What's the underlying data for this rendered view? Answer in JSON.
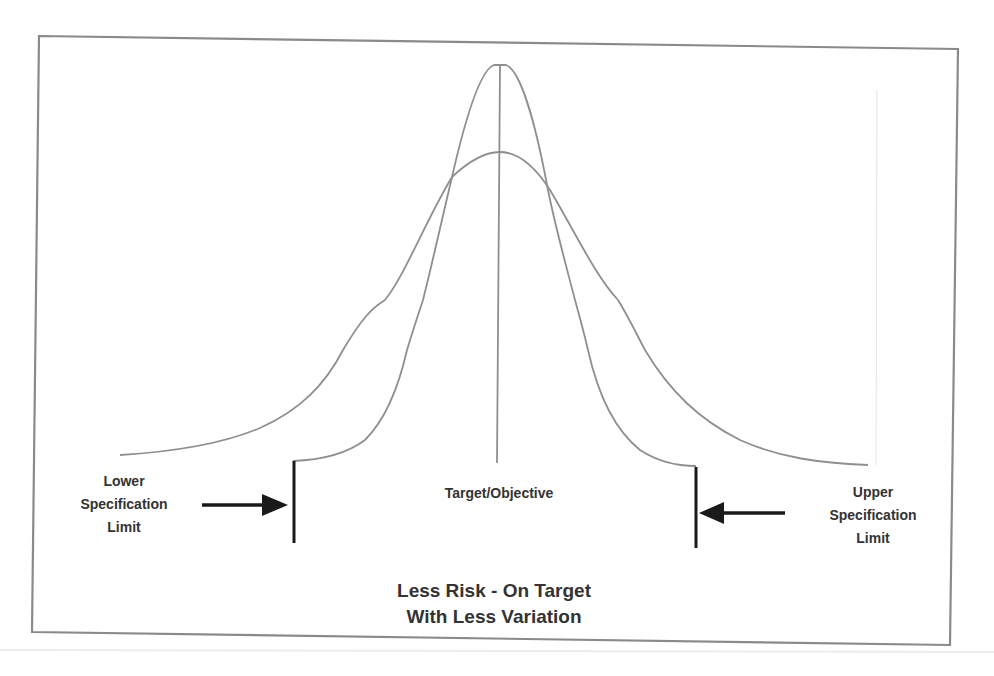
{
  "diagram": {
    "type": "process-capability-normal-curves",
    "labels": {
      "lower_spec_limit": [
        "Lower",
        "Specification",
        "Limit"
      ],
      "upper_spec_limit": [
        "Upper",
        "Specification",
        "Limit"
      ],
      "target": "Target/Objective",
      "caption": [
        "Less Risk - On Target",
        "With Less Variation"
      ]
    },
    "curves": [
      {
        "name": "wide-distribution",
        "description": "Wider variation bell curve, centered on target"
      },
      {
        "name": "narrow-distribution",
        "description": "Narrow variation bell curve, centered on target, within spec limits"
      }
    ],
    "markers": {
      "target_line": "vertical line at center",
      "lower_spec_limit_bar": "vertical bar with arrow pointing right",
      "upper_spec_limit_bar": "vertical bar with arrow pointing left"
    },
    "colors": {
      "frame": "#8a8a8a",
      "curve": "#8f8f8f",
      "limit_bar": "#1a1a1a",
      "text": "#333333"
    }
  }
}
